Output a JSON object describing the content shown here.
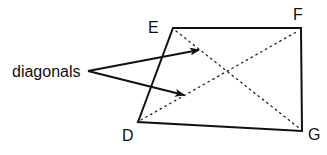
{
  "diagram": {
    "type": "quadrilateral-with-diagonals",
    "vertices": [
      {
        "name": "D",
        "label": "D"
      },
      {
        "name": "E",
        "label": "E"
      },
      {
        "name": "F",
        "label": "F"
      },
      {
        "name": "G",
        "label": "G"
      }
    ],
    "edges": [
      "DE",
      "EF",
      "FG",
      "GD"
    ],
    "diagonals": [
      "EG",
      "DF"
    ],
    "annotation": {
      "text": "diagonals",
      "arrow_count": 2
    },
    "colors": {
      "stroke": "#111111",
      "background": "#ffffff"
    }
  }
}
